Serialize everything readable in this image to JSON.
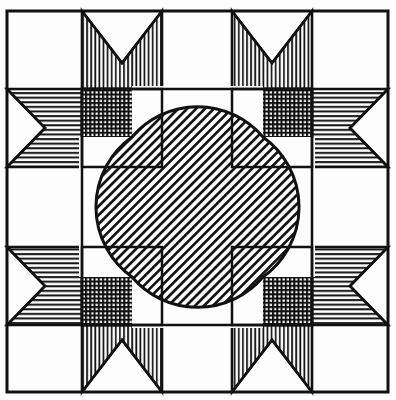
{
  "document": {
    "title": "Geometric Quilt Block Pattern",
    "type": "line-art-diagram",
    "medium": "pen-and-ink hatching",
    "canvas": {
      "width": 396,
      "height": 400
    },
    "background_color": "#fdfdfd",
    "ink_color": "#111111",
    "paper_tone": "#ffffff"
  },
  "frame": {
    "name": "outer-border",
    "x": 7,
    "y": 11,
    "width": 381,
    "height": 381,
    "stroke_width": 3,
    "color": "#111111"
  },
  "grid": {
    "description": "Underlying construction grid dividing the block",
    "vertical_lines": [
      7,
      82,
      162,
      232,
      312,
      388
    ],
    "horizontal_lines": [
      11,
      89,
      167,
      247,
      325,
      392
    ],
    "stroke_width": 1.4,
    "color": "#111111"
  },
  "geometry": {
    "center_x": 197.5,
    "center_y": 207,
    "inner_box": {
      "left": 82,
      "top": 89,
      "right": 312,
      "bottom": 325
    },
    "arc_radius": 86
  },
  "hatch_patterns": [
    {
      "id": "vertical",
      "name": "vertical-line-hatch",
      "angle_deg": 90,
      "spacing": 4.1,
      "stroke": 1.7,
      "color": "#111111"
    },
    {
      "id": "horizontal",
      "name": "horizontal-line-hatch",
      "angle_deg": 0,
      "spacing": 4.6,
      "stroke": 1.9,
      "color": "#111111"
    },
    {
      "id": "cross",
      "name": "cross-hatch-grid",
      "angle_deg": 0,
      "spacing": 4.2,
      "stroke": 2.1,
      "color": "#111111"
    },
    {
      "id": "diagonal",
      "name": "diagonal-hatch-45",
      "angle_deg": 45,
      "spacing": 4.4,
      "stroke": 1.9,
      "color": "#111111"
    }
  ],
  "shapes": {
    "star_points_vertical": [
      {
        "name": "star-point-top-left",
        "fill": "vertical",
        "path": "M82,11 L162,11 L162,89 L82,89 Z",
        "notch": "V-notch from top edge down to center apex"
      },
      {
        "name": "star-point-top-right",
        "fill": "vertical",
        "path": "M232,11 L312,11 L312,89 L232,89 Z",
        "notch": "V-notch from top edge down to center apex"
      },
      {
        "name": "star-point-bottom-left",
        "fill": "vertical",
        "path": "M82,325 L162,325 L162,392 L82,392 Z",
        "notch": "V-notch from bottom edge up to center apex"
      },
      {
        "name": "star-point-bottom-right",
        "fill": "vertical",
        "path": "M232,325 L312,325 L312,392 L232,392 Z",
        "notch": "V-notch from bottom edge up to center apex"
      }
    ],
    "star_points_horizontal": [
      {
        "name": "star-arm-left-upper",
        "fill": "horizontal",
        "notch": "right-pointing chevron notch at left edge"
      },
      {
        "name": "star-arm-left-lower",
        "fill": "horizontal",
        "notch": "right-pointing chevron notch at left edge"
      },
      {
        "name": "star-arm-right-upper",
        "fill": "horizontal",
        "notch": "left-pointing chevron notch at right edge"
      },
      {
        "name": "star-arm-right-lower",
        "fill": "horizontal",
        "notch": "left-pointing chevron notch at right edge"
      }
    ],
    "corner_blocks": [
      {
        "name": "crosshatch-block-top-left",
        "fill": "cross",
        "bounds": [
          82,
          89,
          162,
          167
        ]
      },
      {
        "name": "crosshatch-block-top-right",
        "fill": "cross",
        "bounds": [
          232,
          89,
          312,
          167
        ]
      },
      {
        "name": "crosshatch-block-bottom-left",
        "fill": "cross",
        "bounds": [
          82,
          247,
          162,
          325
        ]
      },
      {
        "name": "crosshatch-block-bottom-right",
        "fill": "cross",
        "bounds": [
          232,
          247,
          312,
          325
        ]
      }
    ],
    "center_medallion": {
      "name": "center-astroid",
      "fill": "diagonal",
      "description": "Concave four-sided star (astroid) formed by four circular arcs bulging inward",
      "arc_radius": 86,
      "corners": [
        [
          132,
          137
        ],
        [
          263,
          137
        ],
        [
          263,
          277
        ],
        [
          132,
          277
        ]
      ]
    },
    "blank_cells": [
      {
        "name": "blank-cell-top-center",
        "bounds": [
          162,
          11,
          232,
          89
        ]
      },
      {
        "name": "blank-cell-left-center",
        "bounds": [
          7,
          167,
          82,
          247
        ]
      },
      {
        "name": "blank-cell-right-center",
        "bounds": [
          312,
          167,
          388,
          247
        ]
      },
      {
        "name": "blank-cell-bottom-center",
        "bounds": [
          162,
          325,
          232,
          392
        ]
      },
      {
        "name": "blank-cell-corner-tl",
        "bounds": [
          7,
          11,
          82,
          89
        ]
      },
      {
        "name": "blank-cell-corner-tr",
        "bounds": [
          312,
          11,
          388,
          89
        ]
      },
      {
        "name": "blank-cell-corner-bl",
        "bounds": [
          7,
          325,
          82,
          392
        ]
      },
      {
        "name": "blank-cell-corner-br",
        "bounds": [
          312,
          325,
          388,
          392
        ]
      }
    ]
  },
  "legend": {
    "visible": false,
    "labels": []
  }
}
